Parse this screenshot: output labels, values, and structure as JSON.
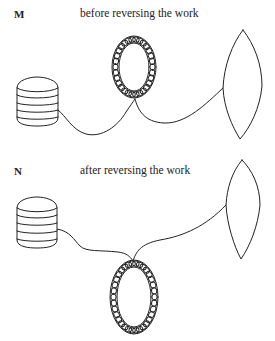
{
  "panels": [
    {
      "label": "M",
      "title": "before reversing the work",
      "components": [
        "yarn-ball",
        "stitch-ring",
        "lens-shape"
      ]
    },
    {
      "label": "N",
      "title": "after reversing the work",
      "components": [
        "yarn-ball",
        "stitch-ring",
        "lens-shape"
      ]
    }
  ]
}
